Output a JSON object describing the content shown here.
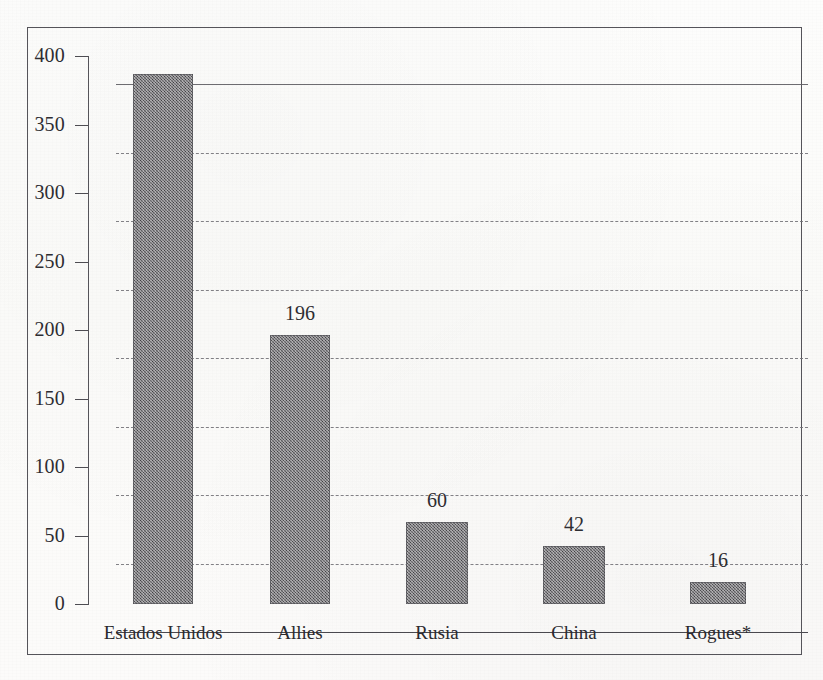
{
  "figure": {
    "frame_border_color": "#55545a",
    "paper_color": "#fcfbfa",
    "bar_fill_color": "#6d6c70",
    "text_color": "#2b2a2f",
    "gridline_color": "#6e6d73"
  },
  "chart_data": {
    "type": "bar",
    "title": "",
    "subtitle": "",
    "xlabel": "",
    "ylabel": "",
    "categories": [
      "Estados Unidos",
      "Allies",
      "Rusia",
      "China",
      "Rogues*"
    ],
    "values": [
      387,
      196,
      60,
      42,
      16
    ],
    "data_labels": [
      "",
      "196",
      "60",
      "42",
      "16"
    ],
    "ylim": [
      0,
      400
    ],
    "ytick_values": [
      0,
      50,
      100,
      150,
      200,
      250,
      300,
      350,
      400
    ],
    "ytick_labels": [
      "0",
      "50",
      "100",
      "150",
      "200",
      "250",
      "300",
      "350",
      "400"
    ],
    "grid": "horizontal-dashed",
    "legend": "none",
    "annotations": [
      "Rogues*"
    ]
  }
}
